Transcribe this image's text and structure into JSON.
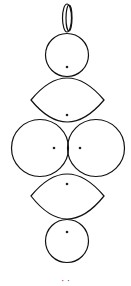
{
  "diagram": {
    "title": "",
    "stroke_color": "#111111",
    "dot_color": "#222222",
    "background": "#ffffff",
    "shapes": [
      {
        "id": "top-ring",
        "type": "ring",
        "cx": 67,
        "cy": 18,
        "rx": 5,
        "ry": 15
      },
      {
        "id": "top-circle",
        "type": "circle",
        "cx": 67,
        "cy": 55,
        "r": 21,
        "dot": [
          67,
          67
        ]
      },
      {
        "id": "upper-lens",
        "type": "lens",
        "left": [
          31,
          100
        ],
        "right": [
          104,
          100
        ],
        "top": 78,
        "bottom": 122,
        "dot": [
          67,
          115
        ]
      },
      {
        "id": "left-circle",
        "type": "circle",
        "cx": 40,
        "cy": 148,
        "r": 28,
        "dot": [
          54,
          148
        ]
      },
      {
        "id": "right-circle",
        "type": "circle",
        "cx": 96,
        "cy": 148,
        "r": 28,
        "dot": [
          80,
          148
        ]
      },
      {
        "id": "lower-lens",
        "type": "lens",
        "left": [
          31,
          196
        ],
        "right": [
          104,
          196
        ],
        "top": 174,
        "bottom": 220,
        "dot": [
          67,
          184
        ]
      },
      {
        "id": "bottom-circle",
        "type": "circle",
        "cx": 67,
        "cy": 241,
        "r": 21,
        "dot": [
          67,
          232
        ]
      }
    ],
    "caption": "· ·"
  }
}
